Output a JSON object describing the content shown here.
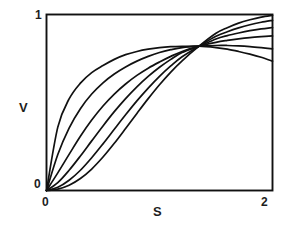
{
  "figure": {
    "title": "",
    "background": "#ffffff",
    "line_color": "#111111",
    "frame_color": "#111111"
  },
  "axes": {
    "y_label": "V",
    "x_label": "S",
    "y_ticks": [
      "1",
      "0"
    ],
    "x_ticks": [
      "0",
      "2"
    ],
    "y_tick_top": "1",
    "y_tick_bottom": "0",
    "x_tick_left": "0",
    "x_tick_right": "2"
  },
  "chart_data": {
    "type": "line",
    "title": "",
    "xlabel": "S",
    "ylabel": "V",
    "xlim": [
      0,
      2
    ],
    "ylim": [
      0,
      1
    ],
    "grid": false,
    "legend": null,
    "x_tick_labels": [
      "0",
      "2"
    ],
    "y_tick_labels": [
      "0",
      "1"
    ],
    "x_tick_values": [
      0,
      2
    ],
    "y_tick_values": [
      0,
      1
    ],
    "crossing_point": {
      "x": 1.35,
      "y": 0.82
    },
    "n_series": 6,
    "x": [
      0,
      0.1,
      0.2,
      0.3,
      0.4,
      0.5,
      0.6,
      0.7,
      0.8,
      0.9,
      1.0,
      1.1,
      1.2,
      1.35,
      1.5,
      1.6,
      1.7,
      1.8,
      1.9,
      2.0
    ],
    "series": [
      {
        "name": "curve-1",
        "values": [
          0.0,
          0.36,
          0.52,
          0.61,
          0.67,
          0.71,
          0.745,
          0.772,
          0.79,
          0.803,
          0.812,
          0.817,
          0.819,
          0.82,
          0.812,
          0.803,
          0.79,
          0.775,
          0.757,
          0.735
        ]
      },
      {
        "name": "curve-2",
        "values": [
          0.0,
          0.205,
          0.355,
          0.465,
          0.548,
          0.612,
          0.662,
          0.702,
          0.735,
          0.762,
          0.784,
          0.8,
          0.812,
          0.82,
          0.824,
          0.824,
          0.822,
          0.818,
          0.812,
          0.805
        ]
      },
      {
        "name": "curve-3",
        "values": [
          0.0,
          0.1,
          0.205,
          0.308,
          0.4,
          0.48,
          0.548,
          0.605,
          0.654,
          0.695,
          0.73,
          0.762,
          0.79,
          0.82,
          0.842,
          0.853,
          0.862,
          0.869,
          0.874,
          0.878
        ]
      },
      {
        "name": "curve-4",
        "values": [
          0.0,
          0.045,
          0.115,
          0.196,
          0.282,
          0.367,
          0.448,
          0.522,
          0.589,
          0.648,
          0.7,
          0.745,
          0.784,
          0.82,
          0.861,
          0.88,
          0.895,
          0.908,
          0.918,
          0.926
        ]
      },
      {
        "name": "curve-5",
        "values": [
          0.0,
          0.018,
          0.058,
          0.115,
          0.186,
          0.265,
          0.348,
          0.43,
          0.509,
          0.582,
          0.649,
          0.708,
          0.76,
          0.82,
          0.876,
          0.902,
          0.924,
          0.942,
          0.956,
          0.967
        ]
      },
      {
        "name": "curve-6",
        "values": [
          0.0,
          0.008,
          0.03,
          0.068,
          0.122,
          0.19,
          0.268,
          0.352,
          0.438,
          0.522,
          0.601,
          0.673,
          0.737,
          0.82,
          0.893,
          0.925,
          0.951,
          0.97,
          0.985,
          0.995
        ]
      }
    ]
  }
}
